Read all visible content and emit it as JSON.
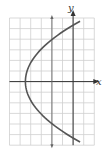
{
  "chart_data": {
    "type": "line",
    "title": "",
    "xlabel": "x",
    "ylabel": "y",
    "xlim": [
      -6,
      2
    ],
    "ylim": [
      -6,
      6
    ],
    "grid": true,
    "grid_step": 1,
    "reference_line": {
      "x": -2
    },
    "series": [
      {
        "name": "parabola",
        "equation": "x = y^2/6.3 - 4.5",
        "vertex": [
          -4.5,
          0
        ],
        "y_range": [
          -5.7,
          5.7
        ],
        "x": [
          1.66,
          0.5,
          -1.1,
          -2.4,
          -3.4,
          -4.1,
          -4.5,
          -4.1,
          -3.4,
          -2.4,
          -1.1,
          0.5,
          1.66
        ],
        "y": [
          5.7,
          5,
          4,
          3,
          2,
          1,
          0,
          -1,
          -2,
          -3,
          -4,
          -5,
          -5.7
        ]
      }
    ],
    "colors": {
      "curve": "#555555",
      "axis": "#333333",
      "grid": "#cfcfcf"
    }
  }
}
